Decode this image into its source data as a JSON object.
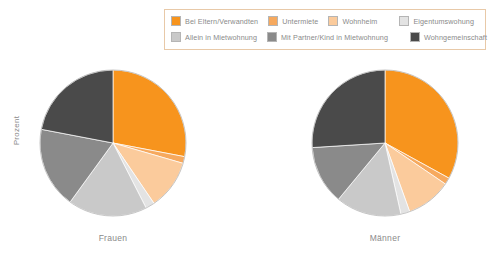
{
  "legend": {
    "rows": [
      [
        {
          "label": "Bei Eltern/Verwandten",
          "color": "#F7941D"
        },
        {
          "label": "Untermiete",
          "color": "#F6A95E"
        },
        {
          "label": "Wohnheim",
          "color": "#FBCB9C"
        },
        {
          "label": "Eigentumswohung",
          "color": "#E3E3E3"
        }
      ],
      [
        {
          "label": "Allein in Mietwohnung",
          "color": "#C9C9C9"
        },
        {
          "label": "Mit Partner/Kind in Mietwohnung",
          "color": "#8A8A8A"
        },
        {
          "label": "Wohngemeinschaft",
          "color": "#4A4A4A"
        }
      ]
    ],
    "border_color": "#E8C9A8",
    "background": "#FFFFFF"
  },
  "axis": {
    "ylabel": "Prozent"
  },
  "chart_data": {
    "type": "pie",
    "title": "",
    "xlabel": "",
    "ylabel": "Prozent",
    "legend_position": "top",
    "grid": false,
    "categories": [
      "Bei Eltern/Verwandten",
      "Untermiete",
      "Wohnheim",
      "Eigentumswohung",
      "Allein in Mietwohnung",
      "Mit Partner/Kind in Mietwohnung",
      "Wohngemeinschaft"
    ],
    "colors": [
      "#F7941D",
      "#F6A95E",
      "#FBCB9C",
      "#E3E3E3",
      "#C9C9C9",
      "#8A8A8A",
      "#4A4A4A"
    ],
    "series": [
      {
        "name": "Frauen",
        "values": [
          28.0,
          1.5,
          11.0,
          2.0,
          17.5,
          18.0,
          22.0
        ]
      },
      {
        "name": "Männer",
        "values": [
          33.0,
          1.5,
          10.0,
          2.0,
          14.5,
          13.0,
          26.0
        ]
      }
    ]
  },
  "pies": [
    {
      "label": "Frauen",
      "series_index": 0
    },
    {
      "label": "Männer",
      "series_index": 1
    }
  ]
}
